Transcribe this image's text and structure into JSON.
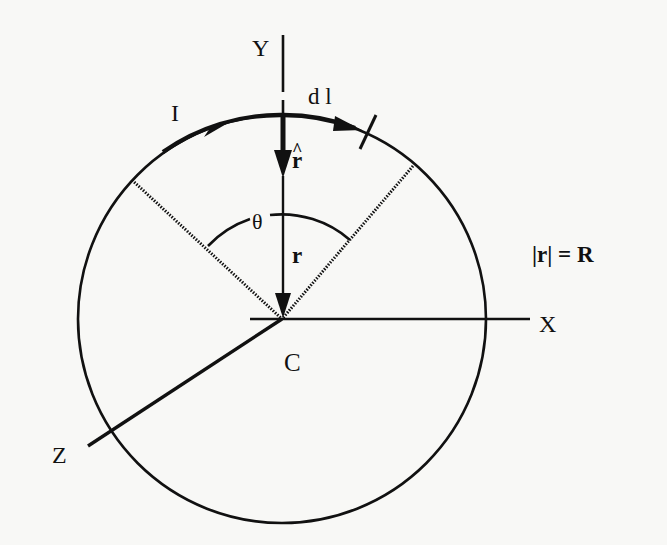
{
  "diagram": {
    "colors": {
      "ink": "#111111",
      "paper": "#f8f8f6"
    },
    "labels": {
      "y_axis": "Y",
      "x_axis": "X",
      "z_axis": "Z",
      "center": "C",
      "current": "I",
      "line_element": "d l",
      "unit_vector": "r",
      "unit_vector_hat": "^",
      "radius_vector": "r",
      "angle": "θ",
      "magnitude_relation": "|r| = R"
    },
    "angle_between_radii_deg": 90
  }
}
